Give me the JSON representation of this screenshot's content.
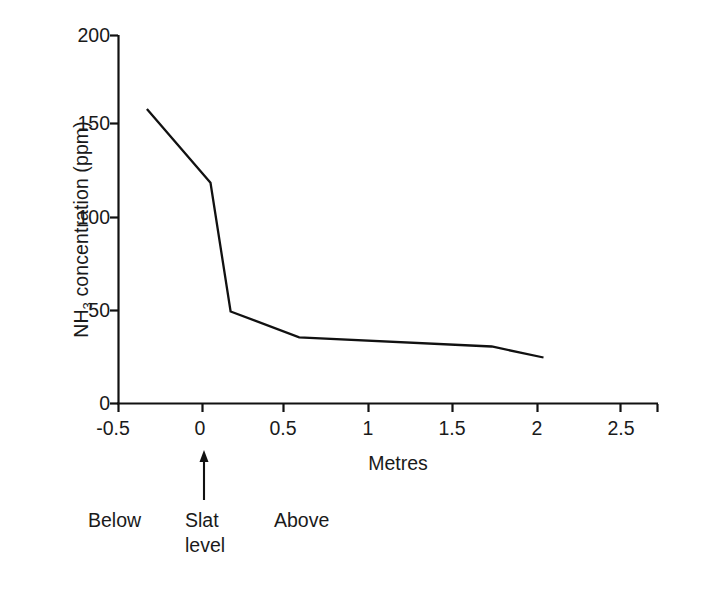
{
  "chart_data": {
    "type": "line",
    "title": "",
    "xlabel": "Metres",
    "ylabel": "NH3 concentration (ppm)",
    "ylabel_base": "NH",
    "ylabel_sub": "3",
    "ylabel_rest": " concentration (ppm)",
    "xlim": [
      -0.5,
      2.5
    ],
    "ylim": [
      0,
      200
    ],
    "grid": false,
    "legend": null,
    "xticks": [
      -0.5,
      0,
      0.5,
      1,
      1.5,
      2,
      2.5
    ],
    "xtick_labels": [
      "-0.5",
      "0",
      "0.5",
      "1",
      "1.5",
      "2",
      "2.5"
    ],
    "yticks": [
      0,
      50,
      100,
      150,
      200
    ],
    "ytick_labels": [
      "0",
      "50",
      "100",
      "150",
      "200"
    ],
    "series": [
      {
        "name": "NH3 concentration",
        "color": "#111111",
        "x": [
          -0.33,
          0.05,
          0.17,
          0.58,
          1.73,
          2.04
        ],
        "y": [
          160,
          120,
          50,
          36,
          31,
          25
        ]
      }
    ],
    "annotations": [
      {
        "id": "below",
        "text": "Below",
        "x": -0.35
      },
      {
        "id": "slat",
        "text": "Slat\nlevel",
        "x": 0.0
      },
      {
        "id": "above",
        "text": "Above",
        "x": 0.52
      }
    ],
    "arrow": {
      "points_to_x": 0,
      "direction": "up"
    }
  }
}
